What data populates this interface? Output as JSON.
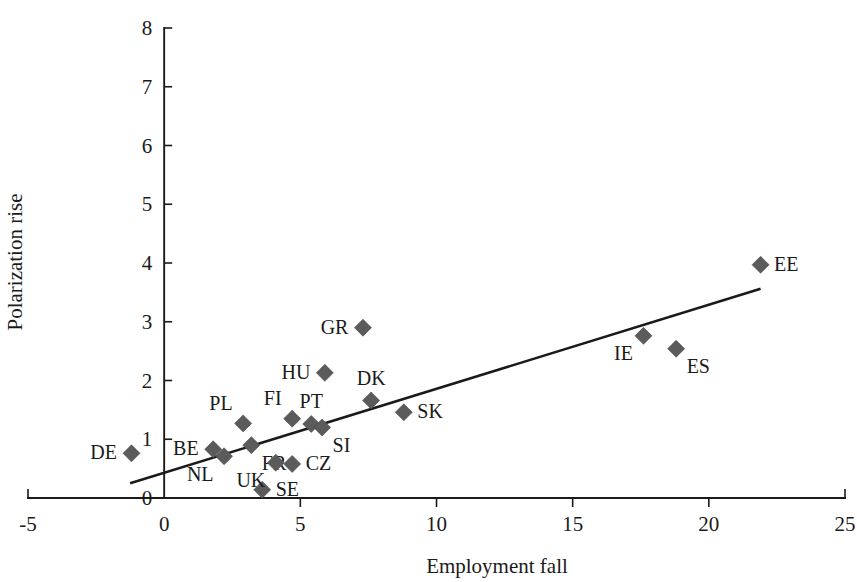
{
  "chart_data": {
    "type": "scatter",
    "title": "",
    "xlabel": "Employment fall",
    "ylabel": "Polarization rise",
    "xlim": [
      -5,
      25
    ],
    "ylim": [
      0,
      8
    ],
    "xticks": [
      -5,
      0,
      5,
      10,
      15,
      20,
      25
    ],
    "yticks": [
      0,
      1,
      2,
      3,
      4,
      5,
      6,
      7,
      8
    ],
    "grid": false,
    "legend": "none",
    "marker_color": "#5b5b5b",
    "line_color": "#1a1a1a",
    "background_color": "#ffffff",
    "points": [
      {
        "label": "DE",
        "x": -1.2,
        "y": 0.76,
        "label_side": "left"
      },
      {
        "label": "BE",
        "x": 1.8,
        "y": 0.83,
        "label_side": "left"
      },
      {
        "label": "NL",
        "x": 2.2,
        "y": 0.71,
        "label_side": "below-left"
      },
      {
        "label": "PL",
        "x": 2.9,
        "y": 1.27,
        "label_side": "above-left"
      },
      {
        "label": "FR",
        "x": 3.2,
        "y": 0.9,
        "label_side": "below-right"
      },
      {
        "label": "SE",
        "x": 3.6,
        "y": 0.14,
        "label_side": "right"
      },
      {
        "label": "UK",
        "x": 4.1,
        "y": 0.6,
        "label_side": "below-left"
      },
      {
        "label": "FI",
        "x": 4.7,
        "y": 1.35,
        "label_side": "above-left"
      },
      {
        "label": "CZ",
        "x": 4.7,
        "y": 0.58,
        "label_side": "right"
      },
      {
        "label": "PT",
        "x": 5.4,
        "y": 1.26,
        "label_side": "above"
      },
      {
        "label": "SI",
        "x": 5.8,
        "y": 1.2,
        "label_side": "below-right"
      },
      {
        "label": "HU",
        "x": 5.9,
        "y": 2.13,
        "label_side": "left"
      },
      {
        "label": "GR",
        "x": 7.3,
        "y": 2.9,
        "label_side": "left"
      },
      {
        "label": "DK",
        "x": 7.6,
        "y": 1.66,
        "label_side": "above"
      },
      {
        "label": "SK",
        "x": 8.8,
        "y": 1.46,
        "label_side": "right"
      },
      {
        "label": "IE",
        "x": 17.6,
        "y": 2.76,
        "label_side": "below-left"
      },
      {
        "label": "ES",
        "x": 18.8,
        "y": 2.54,
        "label_side": "below-right"
      },
      {
        "label": "EE",
        "x": 21.9,
        "y": 3.97,
        "label_side": "right"
      }
    ],
    "trend_line": {
      "x_start": -1.25,
      "y_start": 0.25,
      "x_end": 21.9,
      "y_end": 3.56
    }
  }
}
